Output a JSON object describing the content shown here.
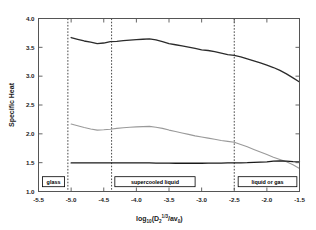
{
  "chart_data": {
    "type": "line",
    "title": "",
    "xlabel": "log10(D2^(1/3)/av0)",
    "ylabel": "Specific Heat",
    "xlim": [
      -5.5,
      -1.5
    ],
    "ylim": [
      1.0,
      4.0
    ],
    "xticks": [
      "-5.5",
      "-5.0",
      "-4.5",
      "-4.0",
      "-3.5",
      "-3.0",
      "-2.5",
      "-2.0",
      "-1.5"
    ],
    "xtick_values": [
      -5.5,
      -5.0,
      -4.5,
      -4.0,
      -3.5,
      -3.0,
      -2.5,
      -2.0,
      -1.5
    ],
    "yticks": [
      "1.0",
      "1.5",
      "2.0",
      "2.5",
      "3.0",
      "3.5",
      "4.0"
    ],
    "ytick_values": [
      1.0,
      1.5,
      2.0,
      2.5,
      3.0,
      3.5,
      4.0
    ],
    "grid": false,
    "legend": "none",
    "series": [
      {
        "name": "upper-curve",
        "color": "#2b2b2b",
        "width": 1.3,
        "x": [
          -5.0,
          -4.9,
          -4.8,
          -4.7,
          -4.6,
          -4.5,
          -4.4,
          -4.3,
          -4.2,
          -4.1,
          -4.0,
          -3.9,
          -3.8,
          -3.7,
          -3.6,
          -3.5,
          -3.4,
          -3.3,
          -3.2,
          -3.1,
          -3.0,
          -2.9,
          -2.8,
          -2.7,
          -2.6,
          -2.5,
          -2.4,
          -2.3,
          -2.2,
          -2.1,
          -2.0,
          -1.9,
          -1.8,
          -1.7,
          -1.6,
          -1.5
        ],
        "values": [
          3.67,
          3.64,
          3.61,
          3.59,
          3.565,
          3.575,
          3.6,
          3.605,
          3.615,
          3.625,
          3.635,
          3.64,
          3.645,
          3.63,
          3.6,
          3.565,
          3.545,
          3.525,
          3.505,
          3.48,
          3.455,
          3.445,
          3.425,
          3.4,
          3.375,
          3.36,
          3.335,
          3.3,
          3.265,
          3.23,
          3.19,
          3.15,
          3.1,
          3.04,
          2.97,
          2.9
        ]
      },
      {
        "name": "middle-curve",
        "color": "#9a9a9a",
        "width": 1.1,
        "x": [
          -5.0,
          -4.9,
          -4.8,
          -4.7,
          -4.6,
          -4.5,
          -4.4,
          -4.3,
          -4.2,
          -4.1,
          -4.0,
          -3.9,
          -3.8,
          -3.7,
          -3.6,
          -3.5,
          -3.4,
          -3.3,
          -3.2,
          -3.1,
          -3.0,
          -2.9,
          -2.8,
          -2.7,
          -2.6,
          -2.5,
          -2.4,
          -2.3,
          -2.2,
          -2.1,
          -2.0,
          -1.9,
          -1.8,
          -1.7,
          -1.6,
          -1.5
        ],
        "values": [
          2.17,
          2.14,
          2.11,
          2.085,
          2.065,
          2.07,
          2.08,
          2.095,
          2.105,
          2.115,
          2.12,
          2.125,
          2.13,
          2.115,
          2.095,
          2.065,
          2.04,
          2.015,
          1.99,
          1.965,
          1.945,
          1.925,
          1.905,
          1.885,
          1.87,
          1.855,
          1.815,
          1.775,
          1.73,
          1.685,
          1.64,
          1.595,
          1.555,
          1.515,
          1.465,
          1.4
        ]
      },
      {
        "name": "flat-curve",
        "color": "#1a1a1a",
        "width": 1.3,
        "x": [
          -5.0,
          -4.9,
          -4.8,
          -4.7,
          -4.6,
          -4.5,
          -4.4,
          -4.3,
          -4.2,
          -4.1,
          -4.0,
          -3.9,
          -3.8,
          -3.7,
          -3.6,
          -3.5,
          -3.4,
          -3.3,
          -3.2,
          -3.1,
          -3.0,
          -2.9,
          -2.8,
          -2.7,
          -2.6,
          -2.5,
          -2.4,
          -2.3,
          -2.2,
          -2.1,
          -2.0,
          -1.9,
          -1.8,
          -1.7,
          -1.6,
          -1.5
        ],
        "values": [
          1.495,
          1.495,
          1.495,
          1.495,
          1.495,
          1.495,
          1.495,
          1.495,
          1.498,
          1.498,
          1.498,
          1.495,
          1.495,
          1.492,
          1.492,
          1.492,
          1.49,
          1.49,
          1.49,
          1.49,
          1.49,
          1.492,
          1.492,
          1.492,
          1.495,
          1.495,
          1.498,
          1.5,
          1.505,
          1.51,
          1.515,
          1.525,
          1.53,
          1.525,
          1.518,
          1.515
        ]
      }
    ],
    "vlines": [
      {
        "name": "glass-boundary",
        "x": -5.05
      },
      {
        "name": "supercooled-boundary",
        "x": -4.38
      },
      {
        "name": "liquid-boundary",
        "x": -2.5
      }
    ],
    "annotations": [
      {
        "name": "glass",
        "label": "glass",
        "x_center": -5.27,
        "x_left": -5.44,
        "x_right": -5.1,
        "y": 1.17
      },
      {
        "name": "supercooled-liquid",
        "label": "supercooled liquid",
        "x_center": -3.72,
        "x_left": -4.33,
        "x_right": -3.1,
        "y": 1.17
      },
      {
        "name": "liquid-or-gas",
        "label": "liquid or gas",
        "x_center": -1.92,
        "x_left": -2.44,
        "x_right": -1.54,
        "y": 1.17
      }
    ]
  },
  "axis": {
    "ylabel": "Specific Heat",
    "xlabel_main": "log",
    "xlabel_sub1": "10",
    "xlabel_open": "(D",
    "xlabel_sub2": "2",
    "xlabel_exp": "1/3",
    "xlabel_mid": "/av",
    "xlabel_sub3": "0",
    "xlabel_close": ")"
  },
  "colors": {
    "frame": "#555555",
    "upper_curve": "#2b2b2b",
    "middle_curve": "#9a9a9a",
    "flat_curve": "#1a1a1a",
    "dashed_line": "#333333",
    "background": "#ffffff"
  }
}
